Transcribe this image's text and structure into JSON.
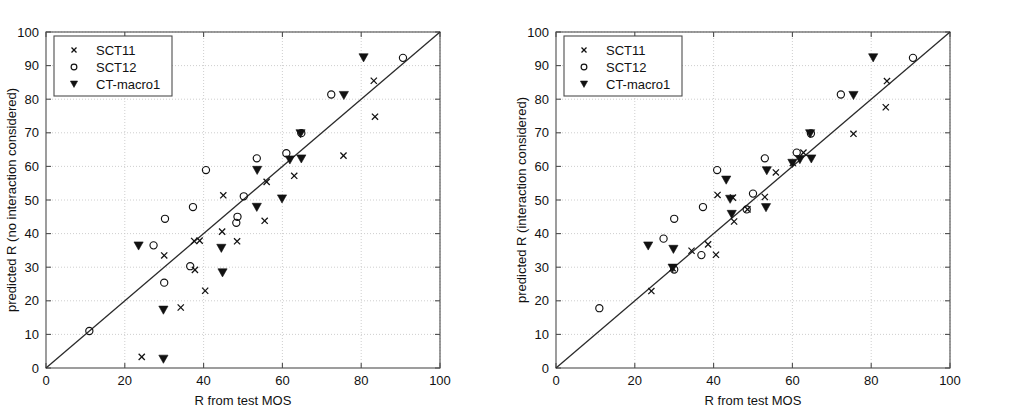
{
  "figure": {
    "width": 1021,
    "height": 420,
    "background": "#ffffff",
    "marker_color": "#111111",
    "axis_color": "#4d4d4d",
    "grid_color": "#c8c8c8",
    "line_color": "#2a2a2a"
  },
  "chart_data": [
    {
      "type": "scatter",
      "panel": "left",
      "title": "",
      "xlabel": "R from test MOS",
      "ylabel": "predicted R (no interaction considered)",
      "xlim": [
        0,
        100
      ],
      "ylim": [
        0,
        100
      ],
      "xticks": [
        0,
        20,
        40,
        60,
        80,
        100
      ],
      "yticks": [
        0,
        10,
        20,
        30,
        40,
        50,
        60,
        70,
        80,
        90,
        100
      ],
      "grid": true,
      "legend_position": "upper-left",
      "reference_line": {
        "label": "identity",
        "from": [
          0,
          0
        ],
        "to": [
          100,
          100
        ]
      },
      "series": [
        {
          "name": "SCT11",
          "marker": "x",
          "points": [
            [
              24.3,
              3.3
            ],
            [
              34.2,
              18.0
            ],
            [
              40.4,
              23.0
            ],
            [
              37.8,
              29.2
            ],
            [
              30.0,
              33.5
            ],
            [
              37.6,
              37.8
            ],
            [
              48.5,
              37.7
            ],
            [
              39.0,
              37.9
            ],
            [
              44.7,
              40.6
            ],
            [
              55.5,
              43.8
            ],
            [
              45.0,
              51.4
            ],
            [
              56.0,
              55.4
            ],
            [
              63.0,
              57.2
            ],
            [
              75.5,
              63.2
            ],
            [
              83.5,
              74.8
            ],
            [
              83.2,
              85.5
            ]
          ]
        },
        {
          "name": "SCT12",
          "marker": "o",
          "points": [
            [
              11.0,
              11.0
            ],
            [
              30.0,
              25.4
            ],
            [
              36.6,
              30.3
            ],
            [
              27.3,
              36.5
            ],
            [
              30.2,
              44.4
            ],
            [
              37.3,
              47.9
            ],
            [
              48.6,
              45.0
            ],
            [
              48.3,
              43.2
            ],
            [
              50.2,
              51.1
            ],
            [
              40.6,
              58.9
            ],
            [
              53.5,
              62.4
            ],
            [
              61.0,
              63.9
            ],
            [
              64.8,
              69.9
            ],
            [
              72.4,
              81.4
            ],
            [
              90.6,
              92.3
            ]
          ]
        },
        {
          "name": "CT-macro1",
          "marker": "v",
          "points": [
            [
              29.8,
              2.7
            ],
            [
              29.8,
              17.3
            ],
            [
              44.8,
              28.4
            ],
            [
              44.5,
              35.7
            ],
            [
              23.5,
              36.4
            ],
            [
              53.5,
              47.9
            ],
            [
              59.9,
              50.4
            ],
            [
              53.6,
              58.9
            ],
            [
              61.9,
              62.0
            ],
            [
              64.8,
              62.3
            ],
            [
              64.6,
              69.8
            ],
            [
              75.6,
              81.2
            ],
            [
              80.6,
              92.4
            ]
          ]
        }
      ]
    },
    {
      "type": "scatter",
      "panel": "right",
      "title": "",
      "xlabel": "R from test MOS",
      "ylabel": "predicted R (interaction considered)",
      "xlim": [
        0,
        100
      ],
      "ylim": [
        0,
        100
      ],
      "xticks": [
        0,
        20,
        40,
        60,
        80,
        100
      ],
      "yticks": [
        0,
        10,
        20,
        30,
        40,
        50,
        60,
        70,
        80,
        90,
        100
      ],
      "grid": true,
      "legend_position": "upper-left",
      "reference_line": {
        "label": "identity",
        "from": [
          0,
          0
        ],
        "to": [
          100,
          100
        ]
      },
      "series": [
        {
          "name": "SCT11",
          "marker": "x",
          "points": [
            [
              24.2,
              22.9
            ],
            [
              29.6,
              29.7
            ],
            [
              40.6,
              33.7
            ],
            [
              34.4,
              34.9
            ],
            [
              38.6,
              36.8
            ],
            [
              45.2,
              43.6
            ],
            [
              48.6,
              47.2
            ],
            [
              44.9,
              50.7
            ],
            [
              41.0,
              51.5
            ],
            [
              53.0,
              50.9
            ],
            [
              55.8,
              58.2
            ],
            [
              60.1,
              61.0
            ],
            [
              62.8,
              64.1
            ],
            [
              75.5,
              69.7
            ],
            [
              83.7,
              77.6
            ],
            [
              84.0,
              85.4
            ]
          ]
        },
        {
          "name": "SCT12",
          "marker": "o",
          "points": [
            [
              11.0,
              17.8
            ],
            [
              30.0,
              29.3
            ],
            [
              36.9,
              33.6
            ],
            [
              27.3,
              38.5
            ],
            [
              30.0,
              44.4
            ],
            [
              37.3,
              47.9
            ],
            [
              48.4,
              47.2
            ],
            [
              50.0,
              51.9
            ],
            [
              40.9,
              58.9
            ],
            [
              53.0,
              62.4
            ],
            [
              61.1,
              64.1
            ],
            [
              64.7,
              69.8
            ],
            [
              72.3,
              81.4
            ],
            [
              90.6,
              92.3
            ]
          ]
        },
        {
          "name": "CT-macro1",
          "marker": "v",
          "points": [
            [
              29.6,
              29.8
            ],
            [
              29.8,
              35.4
            ],
            [
              23.4,
              36.4
            ],
            [
              44.6,
              45.8
            ],
            [
              44.2,
              50.3
            ],
            [
              53.3,
              47.8
            ],
            [
              43.2,
              56.0
            ],
            [
              53.5,
              58.8
            ],
            [
              60.0,
              61.0
            ],
            [
              61.9,
              62.1
            ],
            [
              64.8,
              62.3
            ],
            [
              64.5,
              69.8
            ],
            [
              75.5,
              81.2
            ],
            [
              80.5,
              92.4
            ]
          ]
        }
      ]
    }
  ]
}
